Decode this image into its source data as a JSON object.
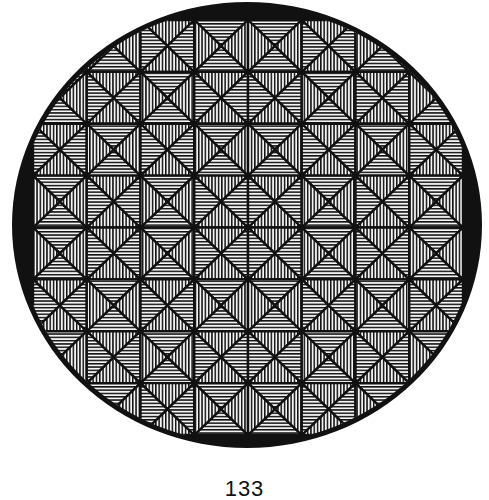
{
  "figure": {
    "shape": "circle",
    "ellipse": {
      "cx": 247,
      "cy": 225,
      "rx": 235,
      "ry": 223
    },
    "inner_clip": {
      "rx": 230,
      "ry": 218
    },
    "grid": {
      "x0": 33,
      "y0": 20,
      "x1": 463,
      "y1": 435,
      "cols": 8,
      "rows": 8
    },
    "cell_types": [
      "BABAABAB",
      "ABABBABA",
      "BABAABAB",
      "ABABBABA",
      "ABABBABA",
      "BABAABAB",
      "ABABBABA",
      "BABAABAB"
    ],
    "cell_type_legend": {
      "A": "top/bottom triangles horizontal hatch, left/right triangles vertical hatch",
      "B": "top/bottom triangles vertical hatch, left/right triangles horizontal hatch"
    },
    "hatch_spacing": 3.3,
    "colors": {
      "ink": "#111111",
      "paper": "#f4f4f4",
      "background": "#ffffff"
    }
  },
  "caption": {
    "page_number": "133"
  }
}
